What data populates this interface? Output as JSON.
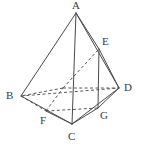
{
  "figure": {
    "type": "geometric-line-diagram",
    "width": 141,
    "height": 148,
    "background_color": "#ffffff",
    "line_color": "#4a4a4a",
    "hidden_line_color": "#5a5a5a",
    "label_color": "#3a3a3a",
    "vertices": [
      {
        "id": "A",
        "label": "A",
        "x": 76,
        "y": 13,
        "label_x": 72,
        "label_y": 0,
        "hidden": false
      },
      {
        "id": "B",
        "label": "B",
        "x": 21,
        "y": 96,
        "label_x": 6,
        "label_y": 90,
        "hidden": false
      },
      {
        "id": "C",
        "label": "C",
        "x": 72,
        "y": 124,
        "label_x": 68,
        "label_y": 131,
        "hidden": false
      },
      {
        "id": "D",
        "label": "D",
        "x": 119,
        "y": 88,
        "label_x": 124,
        "label_y": 82,
        "hidden": false
      },
      {
        "id": "E",
        "label": "E",
        "x": 99,
        "y": 49,
        "label_x": 102,
        "label_y": 36,
        "hidden": false
      },
      {
        "id": "F",
        "label": "F",
        "x": 46,
        "y": 111,
        "label_x": 40,
        "label_y": 115,
        "hidden": false
      },
      {
        "id": "G",
        "label": "G",
        "x": 98,
        "y": 108,
        "label_x": 100,
        "label_y": 110,
        "hidden": false
      },
      {
        "id": "H",
        "label": "",
        "x": 63,
        "y": 88,
        "label_x": 0,
        "label_y": 0,
        "hidden": true
      }
    ],
    "edges_solid": [
      {
        "from": "A",
        "to": "B"
      },
      {
        "from": "A",
        "to": "C"
      },
      {
        "from": "A",
        "to": "D"
      },
      {
        "from": "A",
        "to": "E"
      },
      {
        "from": "B",
        "to": "C"
      },
      {
        "from": "C",
        "to": "D"
      },
      {
        "from": "E",
        "to": "D"
      },
      {
        "from": "E",
        "to": "G"
      },
      {
        "from": "F",
        "to": "C"
      },
      {
        "from": "C",
        "to": "G"
      },
      {
        "from": "G",
        "to": "D"
      }
    ],
    "edges_hidden": [
      {
        "from": "B",
        "to": "D"
      },
      {
        "from": "B",
        "to": "F"
      },
      {
        "from": "F",
        "to": "G"
      },
      {
        "from": "F",
        "to": "H"
      },
      {
        "from": "H",
        "to": "E"
      },
      {
        "from": "H",
        "to": "B"
      },
      {
        "from": "H",
        "to": "D"
      }
    ]
  }
}
